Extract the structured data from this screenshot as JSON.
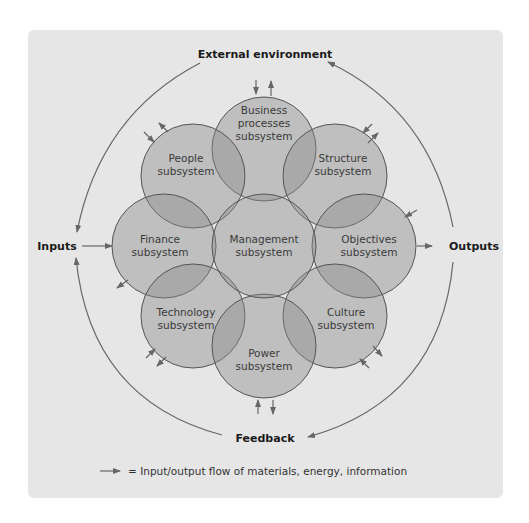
{
  "diagram": {
    "title": "External environment",
    "left_label": "Inputs",
    "right_label": "Outputs",
    "bottom_label": "Feedback",
    "legend_text": "= Input/output flow of materials, energy, information",
    "center": {
      "line1": "Management",
      "line2": "subsystem"
    },
    "subsystems": [
      {
        "id": "business-processes",
        "line1": "Business",
        "line2": "processes",
        "line3": "subsystem"
      },
      {
        "id": "people",
        "line1": "People",
        "line2": "subsystem"
      },
      {
        "id": "structure",
        "line1": "Structure",
        "line2": "subsystem"
      },
      {
        "id": "finance",
        "line1": "Finance",
        "line2": "subsystem"
      },
      {
        "id": "objectives",
        "line1": "Objectives",
        "line2": "subsystem"
      },
      {
        "id": "technology",
        "line1": "Technology",
        "line2": "subsystem"
      },
      {
        "id": "culture",
        "line1": "Culture",
        "line2": "subsystem"
      },
      {
        "id": "power",
        "line1": "Power",
        "line2": "subsystem"
      }
    ],
    "colors": {
      "background": "#e6e6e6",
      "circle_fill": "#8a8a8a",
      "stroke": "#555555",
      "text": "#3a3a3a"
    }
  }
}
